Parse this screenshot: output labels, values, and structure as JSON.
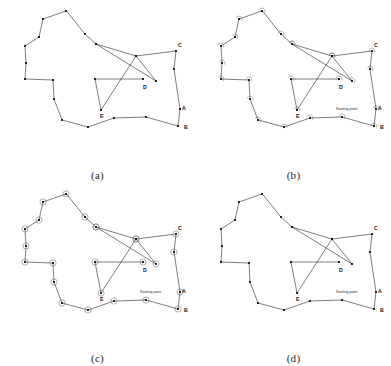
{
  "figure": {
    "background_color": "#ffffff",
    "line_color": "#2e2e2e",
    "vertex_color": "#111111",
    "mark_color": "#6e6e6e"
  },
  "labels": {
    "A": "A",
    "B": "B",
    "C": "C",
    "D": "D",
    "E": "E",
    "starting_point": "Starting point"
  },
  "captions": {
    "a": "(a)",
    "b": "(b)",
    "c": "(c)",
    "d": "(d)"
  },
  "geometry": {
    "outer_boundary": [
      [
        66,
        11
      ],
      [
        43,
        19
      ],
      [
        39,
        37
      ],
      [
        25,
        46
      ],
      [
        26,
        63
      ],
      [
        25,
        79
      ],
      [
        53,
        80
      ],
      [
        54,
        99
      ],
      [
        62,
        120
      ],
      [
        88,
        127
      ],
      [
        114,
        118
      ],
      [
        146,
        117
      ],
      [
        178,
        126
      ],
      [
        180,
        109
      ],
      [
        174,
        69
      ],
      [
        176,
        51
      ],
      [
        136,
        56
      ],
      [
        96,
        44
      ],
      [
        85,
        34
      ]
    ],
    "inner_path": [
      [
        96,
        44
      ],
      [
        156,
        81
      ],
      [
        136,
        56
      ],
      [
        101,
        110
      ],
      [
        95,
        79
      ],
      [
        143,
        79
      ]
    ],
    "vertex_labels": [
      {
        "id": "A",
        "x": 178,
        "y": 108,
        "tx": 182,
        "ty": 110
      },
      {
        "id": "B",
        "x": 180,
        "y": 127,
        "tx": 184,
        "ty": 129
      },
      {
        "id": "C",
        "x": 176,
        "y": 51,
        "tx": 178,
        "ty": 47
      },
      {
        "id": "D",
        "x": 143,
        "y": 79,
        "tx": 143,
        "ty": 89
      },
      {
        "id": "E",
        "x": 101,
        "y": 110,
        "tx": 100,
        "ty": 118
      }
    ],
    "starting_point_marker": {
      "x": 178,
      "y": 108,
      "tx": 140,
      "ty": 110
    }
  },
  "panels": [
    {
      "id": "a",
      "caption": "(a)",
      "vertex_marks": "none",
      "shows_starting_point": false
    },
    {
      "id": "b",
      "caption": "(b)",
      "vertex_marks": "arcs",
      "shows_starting_point": true
    },
    {
      "id": "c",
      "caption": "(c)",
      "vertex_marks": "circles",
      "shows_starting_point": true
    },
    {
      "id": "d",
      "caption": "(d)",
      "vertex_marks": "none",
      "shows_starting_point": true
    }
  ]
}
